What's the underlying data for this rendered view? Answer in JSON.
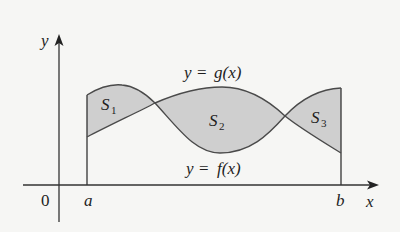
{
  "diagram": {
    "type": "area-between-curves",
    "axes": {
      "x_label": "x",
      "y_label": "y",
      "origin_label": "0",
      "a_label": "a",
      "b_label": "b"
    },
    "curves": {
      "g_label_prefix": "y",
      "g_label_eq": "=",
      "g_label_fn": "g(x)",
      "f_label_prefix": "y",
      "f_label_eq": "=",
      "f_label_fn": "f(x)"
    },
    "regions": [
      {
        "name": "S",
        "sub": "1"
      },
      {
        "name": "S",
        "sub": "2"
      },
      {
        "name": "S",
        "sub": "3"
      }
    ],
    "colors": {
      "shade": "#cfcfcf",
      "curve": "#4a4a4a",
      "axis": "#333333",
      "background": "#f6f6f4"
    }
  }
}
